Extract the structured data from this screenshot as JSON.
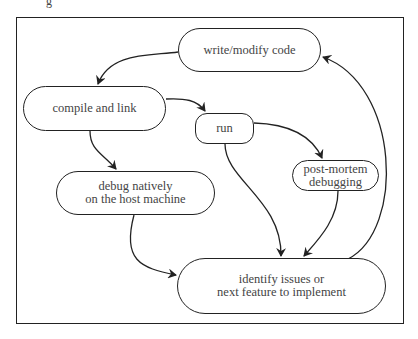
{
  "caption_fragment": "g",
  "diagram": {
    "nodes": [
      {
        "id": "write",
        "label": "write/modify code",
        "lines": [
          "write/modify code"
        ]
      },
      {
        "id": "compile",
        "label": "compile and link",
        "lines": [
          "compile and link"
        ]
      },
      {
        "id": "run",
        "label": "run",
        "lines": [
          "run"
        ]
      },
      {
        "id": "postmortem",
        "label": "post-mortem debugging",
        "lines": [
          "post-mortem",
          "debugging"
        ]
      },
      {
        "id": "debug",
        "label": "debug natively on the host machine",
        "lines": [
          "debug natively",
          "on the host machine"
        ]
      },
      {
        "id": "identify",
        "label": "identify issues or next feature to implement",
        "lines": [
          "identify issues or",
          "next feature to implement"
        ]
      }
    ],
    "edges": [
      {
        "from": "write",
        "to": "compile"
      },
      {
        "from": "compile",
        "to": "run"
      },
      {
        "from": "compile",
        "to": "debug"
      },
      {
        "from": "run",
        "to": "postmortem"
      },
      {
        "from": "run",
        "to": "identify"
      },
      {
        "from": "postmortem",
        "to": "identify"
      },
      {
        "from": "debug",
        "to": "identify"
      },
      {
        "from": "identify",
        "to": "write"
      }
    ]
  }
}
